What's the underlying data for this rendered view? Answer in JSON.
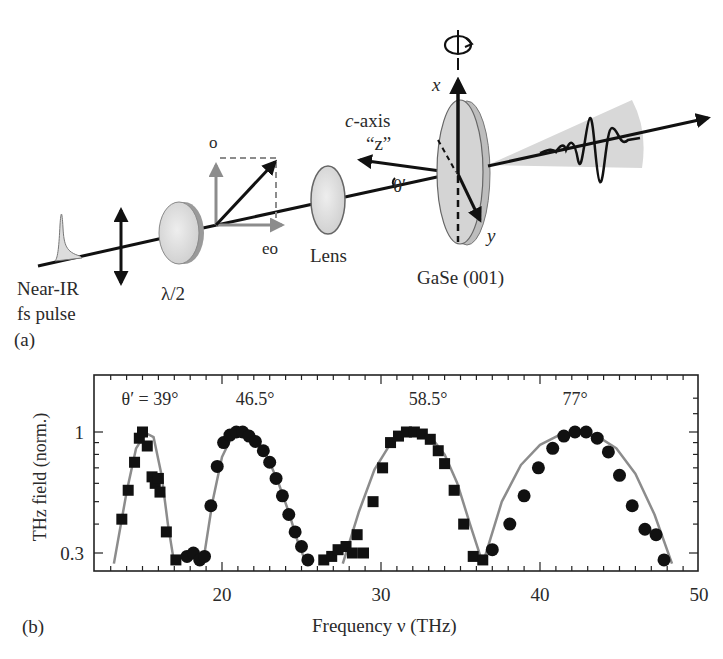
{
  "panel_a": {
    "tag": "(a)",
    "pulse_label_line1": "Near-IR",
    "pulse_label_line2": "fs pulse",
    "waveplate_label": "λ/2",
    "o_label": "o",
    "eo_label": "eo",
    "lens_label": "Lens",
    "caxis_label_prefix": "c",
    "caxis_label_suffix": "-axis",
    "z_label": "“z”",
    "theta_label": "θ′",
    "x_label": "x",
    "y_label": "y",
    "crystal_label": "GaSe (001)",
    "colors": {
      "beam": "#111111",
      "vector_gray": "#8c8c8c",
      "optic_fill": "#d9d9d9",
      "cone_fill": "#d6d6d6"
    }
  },
  "panel_b": {
    "tag": "(b)",
    "ylabel": "THz field (norm.)",
    "xlabel": "Frequency ν (THz)",
    "yticks": [
      "1",
      "0.3"
    ],
    "xticks": [
      "20",
      "30",
      "40",
      "50"
    ],
    "annotations": [
      "θ′ = 39°",
      "46.5°",
      "58.5°",
      "77°"
    ]
  },
  "chart_data": {
    "type": "scatter",
    "title": "",
    "xlabel": "Frequency ν (THz)",
    "ylabel": "THz field (norm.)",
    "xlim": [
      12,
      50
    ],
    "ylim": [
      0.27,
      1.5
    ],
    "yscale": "log",
    "grid": false,
    "legend": "none (curves annotated by θ′ above each peak)",
    "series": [
      {
        "name": "θ′ = 39°",
        "marker": "square",
        "x": [
          13.7,
          14.1,
          14.5,
          14.8,
          15.0,
          15.3,
          15.6,
          15.8,
          16.0,
          16.1,
          16.5,
          17.1
        ],
        "y": [
          0.42,
          0.56,
          0.74,
          0.94,
          1.0,
          0.87,
          0.64,
          0.6,
          0.63,
          0.55,
          0.37,
          0.28
        ]
      },
      {
        "name": "θ′ = 46.5°",
        "marker": "circle",
        "x": [
          17.8,
          18.2,
          18.6,
          18.9,
          19.3,
          19.7,
          20.1,
          20.5,
          20.9,
          21.3,
          21.7,
          22.1,
          22.6,
          23.0,
          23.4,
          23.8,
          24.2,
          24.6,
          25.0,
          25.4
        ],
        "y": [
          0.29,
          0.3,
          0.28,
          0.29,
          0.48,
          0.71,
          0.9,
          0.97,
          1.0,
          1.0,
          0.96,
          0.91,
          0.83,
          0.74,
          0.63,
          0.53,
          0.44,
          0.37,
          0.32,
          0.28
        ],
        "note": "shown as rising edge 18-21 THz, peak ~21 THz, falling to ~25.5 THz"
      },
      {
        "name": "θ′ = 58.5°",
        "marker": "square",
        "x": [
          26.4,
          26.9,
          27.3,
          27.8,
          28.2,
          28.5,
          28.9,
          29.5,
          30.1,
          30.6,
          31.1,
          31.6,
          32.1,
          32.6,
          33.1,
          33.6,
          34.0,
          34.6,
          35.2,
          35.8,
          36.4
        ],
        "y": [
          0.28,
          0.29,
          0.31,
          0.32,
          0.3,
          0.36,
          0.3,
          0.5,
          0.7,
          0.9,
          0.96,
          1.0,
          1.0,
          0.98,
          0.93,
          0.83,
          0.73,
          0.56,
          0.4,
          0.29,
          0.28
        ]
      },
      {
        "name": "θ′ = 77°",
        "marker": "circle",
        "x": [
          37.0,
          38.1,
          39.0,
          39.9,
          40.8,
          41.5,
          42.2,
          42.9,
          43.6,
          44.3,
          45.0,
          45.8,
          46.6,
          47.3,
          47.8
        ],
        "y": [
          0.31,
          0.4,
          0.53,
          0.7,
          0.85,
          0.96,
          1.0,
          1.0,
          0.94,
          0.82,
          0.65,
          0.48,
          0.38,
          0.36,
          0.28
        ]
      }
    ],
    "fit_curves": [
      {
        "name": "fit 39°",
        "color": "#8c8c8c",
        "x": [
          13.2,
          14.0,
          14.6,
          15.2,
          15.7,
          16.2,
          16.6,
          17.0
        ],
        "y": [
          0.27,
          0.55,
          0.85,
          0.99,
          0.95,
          0.65,
          0.4,
          0.27
        ]
      },
      {
        "name": "fit 46.5°",
        "color": "#8c8c8c",
        "x": [
          18.8,
          19.4,
          20.0,
          20.6,
          21.2,
          21.8,
          22.4,
          23.0,
          23.6,
          24.2,
          24.8,
          25.3
        ],
        "y": [
          0.27,
          0.5,
          0.78,
          0.95,
          1.0,
          0.97,
          0.88,
          0.74,
          0.59,
          0.45,
          0.33,
          0.27
        ]
      },
      {
        "name": "fit 58.5°",
        "color": "#8c8c8c",
        "x": [
          27.6,
          28.6,
          29.6,
          30.6,
          31.6,
          32.4,
          33.2,
          34.0,
          34.8,
          35.6,
          36.4
        ],
        "y": [
          0.27,
          0.45,
          0.69,
          0.89,
          0.99,
          1.0,
          0.94,
          0.8,
          0.6,
          0.4,
          0.27
        ]
      },
      {
        "name": "fit 77°",
        "color": "#8c8c8c",
        "x": [
          36.4,
          37.6,
          38.8,
          40.0,
          41.2,
          42.4,
          43.6,
          44.8,
          46.0,
          47.2,
          48.3
        ],
        "y": [
          0.27,
          0.5,
          0.72,
          0.88,
          0.97,
          1.0,
          0.96,
          0.85,
          0.66,
          0.44,
          0.27
        ]
      }
    ]
  }
}
